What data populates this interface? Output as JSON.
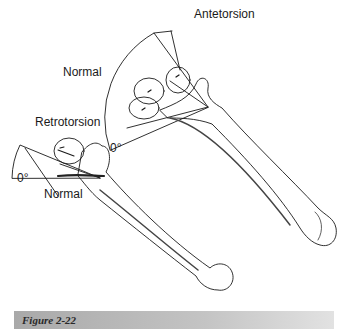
{
  "figure": {
    "labels": {
      "antetorsion": "Antetorsion",
      "normal_upper": "Normal",
      "zero_upper": "0°",
      "retrotorsion": "Retrotorsion",
      "zero_lower": "0°",
      "normal_lower": "Normal"
    },
    "colors": {
      "line": "#1a1a1a",
      "shade": "#555555",
      "caption_bar": "#b8b8b8"
    }
  },
  "caption": {
    "text": "Figure 2-22"
  }
}
